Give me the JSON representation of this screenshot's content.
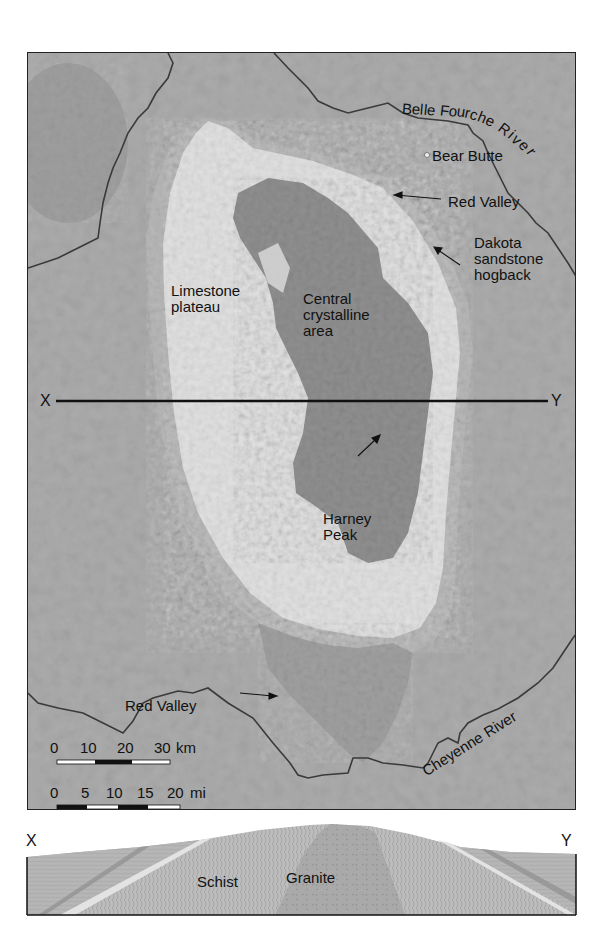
{
  "map": {
    "labels": {
      "belle_fourche_river": "Belle Fourche River",
      "bear_butte": "Bear Butte",
      "red_valley_ne": "Red Valley",
      "dakota_line1": "Dakota",
      "dakota_line2": "sandstone",
      "dakota_line3": "hogback",
      "limestone_line1": "Limestone",
      "limestone_line2": "plateau",
      "central_line1": "Central",
      "central_line2": "crystalline",
      "central_line3": "area",
      "harney_line1": "Harney",
      "harney_line2": "Peak",
      "red_valley_sw": "Red Valley",
      "cheyenne_river": "Cheyenne River",
      "section_start": "X",
      "section_end": "Y"
    },
    "scale_bars": {
      "km": {
        "ticks": [
          "0",
          "10",
          "20",
          "30"
        ],
        "unit": "km"
      },
      "mi": {
        "ticks": [
          "0",
          "5",
          "10",
          "15",
          "20"
        ],
        "unit": "mi"
      }
    },
    "colors": {
      "background_plains": "#a9a9a9",
      "red_valley_band": "#b6b6b6",
      "limestone_plateau": "#dcdcdc",
      "crystalline_core": "#8f8f8f",
      "river": "#3a3a3a",
      "section_line": "#111111"
    }
  },
  "cross_section": {
    "start_label": "X",
    "end_label": "Y",
    "units": {
      "schist": "Schist",
      "granite": "Granite"
    }
  }
}
